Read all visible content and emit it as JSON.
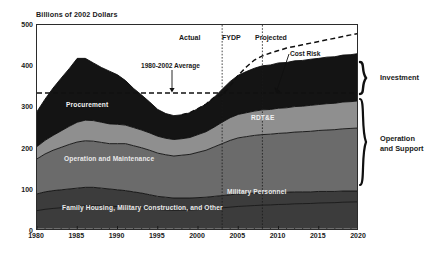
{
  "chart_data": {
    "type": "area",
    "title": "",
    "ylabel": "Billions of 2002 Dollars",
    "xlabel": "",
    "ylim": [
      0,
      500
    ],
    "xlim": [
      1980,
      2020
    ],
    "yticks": [
      0,
      100,
      200,
      300,
      400,
      500
    ],
    "xticks": [
      1980,
      1985,
      1990,
      1995,
      2000,
      2005,
      2010,
      2015,
      2020
    ],
    "grid": false,
    "legend_position": "inline-band-labels",
    "stacked": true,
    "x": [
      1980,
      1981,
      1982,
      1983,
      1984,
      1985,
      1986,
      1987,
      1988,
      1989,
      1990,
      1991,
      1992,
      1993,
      1994,
      1995,
      1996,
      1997,
      1998,
      1999,
      2000,
      2001,
      2002,
      2003,
      2004,
      2005,
      2006,
      2007,
      2008,
      2009,
      2010,
      2011,
      2012,
      2013,
      2014,
      2015,
      2016,
      2017,
      2018,
      2019,
      2020
    ],
    "series": [
      {
        "name": "Family Housing, Military Construction, and Other",
        "color": "#3c3c3c",
        "values": [
          90,
          95,
          98,
          100,
          102,
          104,
          106,
          106,
          104,
          102,
          100,
          98,
          95,
          92,
          88,
          84,
          82,
          80,
          80,
          80,
          81,
          82,
          84,
          86,
          88,
          90,
          91,
          92,
          93,
          93,
          94,
          94,
          95,
          95,
          95,
          96,
          96,
          96,
          97,
          97,
          97
        ]
      },
      {
        "name": "Operation and Maintenance",
        "color": "#6b6b6b",
        "values": [
          85,
          92,
          98,
          103,
          108,
          112,
          113,
          112,
          111,
          110,
          112,
          114,
          112,
          110,
          108,
          105,
          103,
          102,
          104,
          106,
          110,
          114,
          120,
          126,
          132,
          136,
          138,
          140,
          141,
          142,
          143,
          144,
          145,
          146,
          147,
          148,
          149,
          150,
          151,
          152,
          153
        ]
      },
      {
        "name": "RDT&E",
        "color": "#8f8f8f",
        "values": [
          30,
          33,
          36,
          40,
          44,
          48,
          50,
          50,
          49,
          48,
          47,
          45,
          44,
          43,
          42,
          41,
          40,
          40,
          40,
          41,
          43,
          45,
          48,
          52,
          55,
          57,
          58,
          59,
          60,
          60,
          61,
          61,
          62,
          62,
          63,
          63,
          64,
          64,
          65,
          65,
          66
        ]
      },
      {
        "name": "Procurement",
        "color": "#141414",
        "values": [
          85,
          100,
          115,
          128,
          140,
          155,
          150,
          140,
          133,
          128,
          120,
          108,
          95,
          85,
          75,
          65,
          60,
          58,
          58,
          60,
          63,
          67,
          72,
          80,
          88,
          95,
          100,
          104,
          107,
          108,
          110,
          110,
          111,
          111,
          112,
          112,
          113,
          113,
          114,
          114,
          115
        ]
      }
    ],
    "reference_lines": [
      {
        "name": "1980-2002 Average",
        "value": 335,
        "style": "dashed",
        "orientation": "horizontal"
      }
    ],
    "cost_risk_line": {
      "name": "Cost Risk",
      "style": "dashed",
      "values": [
        null,
        null,
        null,
        null,
        null,
        null,
        null,
        null,
        null,
        null,
        null,
        null,
        null,
        null,
        null,
        null,
        null,
        null,
        null,
        null,
        null,
        null,
        null,
        330,
        352,
        378,
        398,
        415,
        425,
        432,
        438,
        444,
        448,
        452,
        456,
        460,
        464,
        468,
        472,
        476,
        480
      ]
    },
    "phase_dividers": [
      2003,
      2008
    ],
    "phases": [
      "Actual",
      "FYDP",
      "Projected"
    ],
    "annotations": [
      "1980-2002 Average",
      "Cost Risk"
    ],
    "braces": [
      "Investment",
      "Operation and Support"
    ]
  },
  "axis": {
    "y_title": "Billions of 2002 Dollars",
    "y_ticks": [
      "500",
      "400",
      "300",
      "200",
      "100",
      "0"
    ],
    "x_ticks": [
      "1980",
      "1985",
      "1990",
      "1995",
      "2000",
      "2005",
      "2010",
      "2015",
      "2020"
    ]
  },
  "phases": {
    "actual": "Actual",
    "fydp": "FYDP",
    "projected": "Projected"
  },
  "annotations": {
    "average": "1980-2002 Average",
    "cost_risk": "Cost Risk"
  },
  "bands": {
    "procurement": "Procurement",
    "rdte": "RDT&E",
    "om": "Operation and Maintenance",
    "family": "Family Housing, Military Construction, and Other",
    "milpers": "Military Personnel"
  },
  "braces": {
    "investment": "Investment",
    "operation_support": "Operation\nand Support"
  }
}
